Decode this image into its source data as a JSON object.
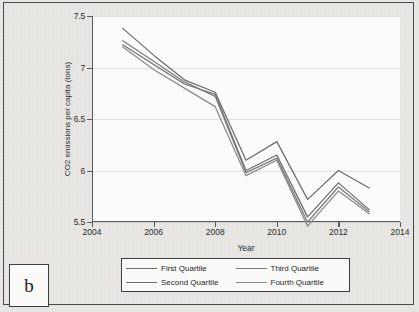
{
  "figure": {
    "panel_label": "b"
  },
  "chart_data": {
    "type": "line",
    "title": "",
    "xlabel": "Year",
    "ylabel": "CO2 emissions per capita (tons)",
    "xlim": [
      2004,
      2014
    ],
    "ylim": [
      5.5,
      7.5
    ],
    "xticks": [
      2004,
      2006,
      2008,
      2010,
      2012,
      2014
    ],
    "xtick_labels": [
      "2004",
      "2006",
      "2008",
      "2010",
      "2012",
      "2014"
    ],
    "yticks": [
      5.5,
      6,
      6.5,
      7,
      7.5
    ],
    "ytick_labels": [
      "5.5",
      "6",
      "6.5",
      "7",
      "7.5"
    ],
    "grid": true,
    "legend_position": "below-axes",
    "x": [
      2005,
      2006,
      2007,
      2008,
      2009,
      2010,
      2011,
      2012,
      2013
    ],
    "series": [
      {
        "name": "First Quartile",
        "color": "#6d6d6d",
        "values": [
          7.38,
          7.12,
          6.88,
          6.76,
          6.1,
          6.28,
          5.72,
          6.0,
          5.83
        ]
      },
      {
        "name": "Second Quartile",
        "color": "#6d6d6d",
        "values": [
          7.22,
          7.03,
          6.84,
          6.74,
          6.0,
          6.15,
          5.55,
          5.88,
          5.62
        ]
      },
      {
        "name": "Third Quartile",
        "color": "#7a7a7a",
        "values": [
          7.26,
          7.06,
          6.86,
          6.72,
          5.98,
          6.12,
          5.5,
          5.84,
          5.6
        ]
      },
      {
        "name": "Fourth Quartile",
        "color": "#8a8a8a",
        "values": [
          7.2,
          6.98,
          6.8,
          6.62,
          5.95,
          6.1,
          5.46,
          5.8,
          5.58
        ]
      }
    ]
  }
}
